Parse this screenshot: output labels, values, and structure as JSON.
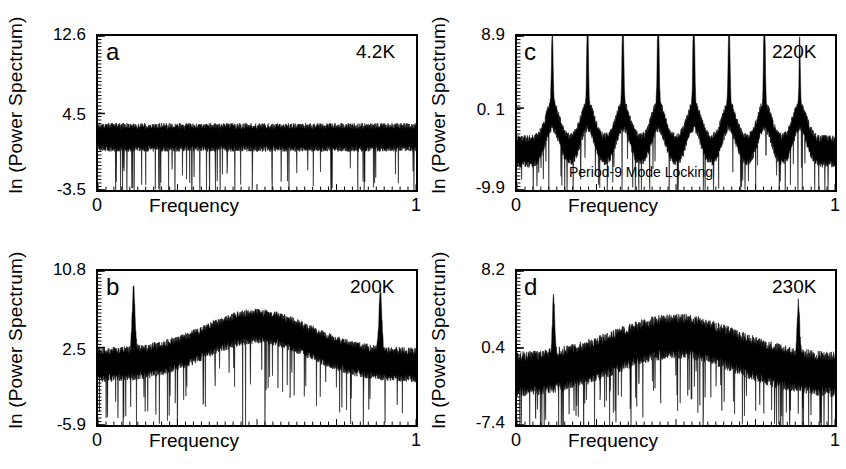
{
  "figure": {
    "background": "#ffffff",
    "trace_color": "#000000",
    "n_panels": 4
  },
  "axis": {
    "ylabel": "ln (Power Spectrum)",
    "xlabel": "Frequency",
    "xmin_label": "0",
    "xmax_label": "1"
  },
  "chart_data": [
    {
      "type": "line",
      "panel": "a",
      "panel_label": "a",
      "temperature_label": "4.2K",
      "title": "",
      "xlabel": "Frequency",
      "ylabel": "ln (Power Spectrum)",
      "xlim": [
        0,
        1
      ],
      "ylim": [
        -3.5,
        12.6
      ],
      "xticks": [
        0,
        1
      ],
      "xtick_labels": [
        "0",
        "1"
      ],
      "yticks": [
        -3.5,
        4.5,
        12.6
      ],
      "ytick_labels": [
        "-3.5",
        "4.5",
        "12.6"
      ],
      "grid": false,
      "legend": "none",
      "annotations": [],
      "description": "Broadband white-noise spectrum, flat baseline with no coherent peaks",
      "noise": {
        "baseline": 2.0,
        "band_halfwidth": 1.5,
        "spike_down_depth": 5.5,
        "spike_down_rate": 0.06,
        "seed": 11,
        "samples": 1100,
        "edge_rise": 0.0
      },
      "peaks": [],
      "hump": null
    },
    {
      "type": "line",
      "panel": "b",
      "panel_label": "b",
      "temperature_label": "200K",
      "title": "",
      "xlabel": "Frequency",
      "ylabel": "ln (Power Spectrum)",
      "xlim": [
        0,
        1
      ],
      "ylim": [
        -5.9,
        10.8
      ],
      "xticks": [
        0,
        1
      ],
      "xtick_labels": [
        "0",
        "1"
      ],
      "yticks": [
        -5.9,
        2.5,
        10.8
      ],
      "ytick_labels": [
        "-5.9",
        "2.5",
        "10.8"
      ],
      "grid": false,
      "legend": "none",
      "annotations": [],
      "description": "Broad hump centred near f=0.5 with sharp fundamental peaks near f=0.11 and f=0.89",
      "noise": {
        "baseline": 0.6,
        "band_halfwidth": 1.9,
        "spike_down_depth": 6.0,
        "spike_down_rate": 0.07,
        "seed": 23,
        "samples": 1100,
        "edge_rise": 0.0
      },
      "peaks": [
        {
          "f": 0.112,
          "height": 6.6,
          "width": 0.006
        },
        {
          "f": 0.888,
          "height": 6.4,
          "width": 0.006
        }
      ],
      "hump": {
        "center": 0.5,
        "height": 4.2,
        "width": 0.23
      }
    },
    {
      "type": "line",
      "panel": "c",
      "panel_label": "c",
      "temperature_label": "220K",
      "title": "",
      "xlabel": "Frequency",
      "ylabel": "ln (Power Spectrum)",
      "xlim": [
        0,
        1
      ],
      "ylim": [
        -9.9,
        8.9
      ],
      "xticks": [
        0,
        1
      ],
      "xtick_labels": [
        "0",
        "1"
      ],
      "yticks": [
        -9.9,
        0.1,
        8.9
      ],
      "ytick_labels": [
        "-9.9",
        "0. 1",
        "8.9"
      ],
      "grid": false,
      "legend": "none",
      "annotations": [
        {
          "text": "Period-9 Mode Locking",
          "f": 0.42,
          "value": -8.1
        }
      ],
      "description": "Eight sharp harmonic peaks evenly spaced at multiples of 1/9, indicating period-9 mode locking",
      "noise": {
        "baseline": -5.2,
        "band_halfwidth": 2.0,
        "spike_down_depth": 5.2,
        "spike_down_rate": 0.05,
        "seed": 37,
        "samples": 1100,
        "edge_rise": 0.0
      },
      "peaks": [
        {
          "f": 0.111,
          "height": 9.0,
          "width": 0.0035
        },
        {
          "f": 0.222,
          "height": 11.5,
          "width": 0.0035
        },
        {
          "f": 0.333,
          "height": 11.8,
          "width": 0.0035
        },
        {
          "f": 0.444,
          "height": 13.5,
          "width": 0.0035
        },
        {
          "f": 0.556,
          "height": 13.6,
          "width": 0.0035
        },
        {
          "f": 0.667,
          "height": 11.3,
          "width": 0.0035
        },
        {
          "f": 0.778,
          "height": 12.0,
          "width": 0.0035
        },
        {
          "f": 0.889,
          "height": 8.2,
          "width": 0.0025
        }
      ],
      "hump": null,
      "peak_shoulders": {
        "width": 0.03,
        "height": 4.4
      }
    },
    {
      "type": "line",
      "panel": "d",
      "panel_label": "d",
      "temperature_label": "230K",
      "title": "",
      "xlabel": "Frequency",
      "ylabel": "ln (Power Spectrum)",
      "xlim": [
        0,
        1
      ],
      "ylim": [
        -7.4,
        8.2
      ],
      "xticks": [
        0,
        1
      ],
      "xtick_labels": [
        "0",
        "1"
      ],
      "yticks": [
        -7.4,
        0.4,
        8.2
      ],
      "ytick_labels": [
        "-7.4",
        "0.4",
        "8.2"
      ],
      "grid": false,
      "legend": "none",
      "annotations": [],
      "description": "Broad noisy hump spanning mid frequencies with residual sharp peaks near f=0.11 and f=0.89",
      "noise": {
        "baseline": -2.4,
        "band_halfwidth": 2.3,
        "spike_down_depth": 5.6,
        "spike_down_rate": 0.08,
        "seed": 53,
        "samples": 1100,
        "edge_rise": 0.0
      },
      "peaks": [
        {
          "f": 0.115,
          "height": 5.6,
          "width": 0.005
        },
        {
          "f": 0.885,
          "height": 5.2,
          "width": 0.005
        }
      ],
      "hump": {
        "center": 0.5,
        "height": 4.0,
        "width": 0.27
      }
    }
  ]
}
